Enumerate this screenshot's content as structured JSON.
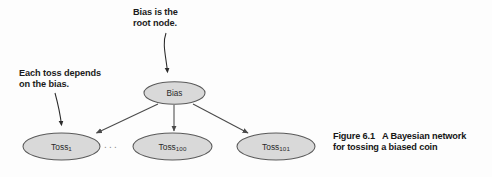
{
  "figure": {
    "caption_label": "Figure 6.1",
    "caption_line1": "A Bayesian network",
    "caption_line2": "for tossing a biased coin"
  },
  "annotations": [
    {
      "id": "root-node-note",
      "text": "Bias is the\nroot node.",
      "points_to": "bias-node"
    },
    {
      "id": "each-toss-note",
      "text": "Each toss depends\non the bias.",
      "points_to": "toss-1-node"
    }
  ],
  "graph": {
    "root": {
      "id": "bias-node",
      "label": "Bias",
      "subscript": ""
    },
    "leaves": [
      {
        "id": "toss-1-node",
        "label": "Toss",
        "subscript": "1"
      },
      {
        "id": "toss-100-node",
        "label": "Toss",
        "subscript": "100"
      },
      {
        "id": "toss-101-node",
        "label": "Toss",
        "subscript": "101"
      }
    ],
    "continuation_marker": "...",
    "edges": [
      {
        "from": "bias-node",
        "to": "toss-1-node"
      },
      {
        "from": "bias-node",
        "to": "toss-100-node"
      },
      {
        "from": "bias-node",
        "to": "toss-101-node"
      }
    ]
  },
  "style": {
    "node_fill": "#d9d9d9",
    "node_stroke": "#5a5a5a",
    "edge_stroke": "#4a4a4a",
    "text_color": "#1b1b1b",
    "page_background": "#fdfdfd"
  }
}
